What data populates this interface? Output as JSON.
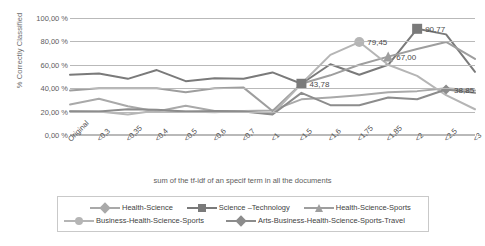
{
  "chart_data": {
    "type": "line",
    "title": "",
    "xlabel": "sum of the tf-idf of an specif term in all the documents",
    "ylabel": "% Correctly Classified",
    "ylim": [
      0,
      100
    ],
    "yticks": [
      "0,00 %",
      "20,00 %",
      "40,00 %",
      "60,00 %",
      "80,00 %",
      "100,00 %"
    ],
    "ytick_values": [
      0,
      20,
      40,
      60,
      80,
      100
    ],
    "grid": true,
    "legend_position": "bottom",
    "categories": [
      "Original",
      "<0,3",
      "<0,35",
      "<0,4",
      "<0,5",
      "<0,6",
      "<0,7",
      "<1",
      "<1,5",
      "<1,6",
      "<1,75",
      "<1,85",
      "<2",
      "<2,5",
      "<3"
    ],
    "series": [
      {
        "name": "Health-Science",
        "color": "#a9a9a9",
        "marker": "diamond",
        "values": [
          26.0,
          31.0,
          24.5,
          20.0,
          25.0,
          20.5,
          20.5,
          21.0,
          30.5,
          32.0,
          34.0,
          36.5,
          37.5,
          40.0,
          38.0
        ]
      },
      {
        "name": "Science –Technology",
        "color": "#7a7a7a",
        "marker": "square",
        "values": [
          51.5,
          52.5,
          48.0,
          55.5,
          46.0,
          48.5,
          48.0,
          53.5,
          43.78,
          60.5,
          51.5,
          60.0,
          90.77,
          86.0,
          54.0
        ]
      },
      {
        "name": "Health-Science-Sports",
        "color": "#9e9e9e",
        "marker": "triangle",
        "values": [
          38.0,
          40.0,
          40.0,
          40.0,
          36.5,
          40.0,
          40.5,
          20.5,
          43.78,
          51.0,
          60.0,
          67.0,
          73.5,
          79.5,
          65.0
        ]
      },
      {
        "name": "Business-Health-Science-Sports",
        "color": "#b5b5b5",
        "marker": "circle",
        "values": [
          20.5,
          20.0,
          17.5,
          21.0,
          20.0,
          19.5,
          20.5,
          18.0,
          43.78,
          68.5,
          79.45,
          60.0,
          50.5,
          34.0,
          22.0
        ]
      },
      {
        "name": "Arts-Business-Health-Science-Sports-Travel",
        "color": "#8c8c8c",
        "marker": "diamond",
        "values": [
          20.0,
          20.0,
          22.0,
          21.5,
          20.0,
          20.5,
          20.0,
          17.5,
          36.0,
          25.5,
          25.5,
          32.0,
          30.5,
          38.85,
          36.0
        ]
      }
    ],
    "annotations": [
      {
        "text": "79,45",
        "series": "Business-Health-Science-Sports",
        "category": "<1,75",
        "value": 79.45
      },
      {
        "text": "43,78",
        "series": "Science –Technology",
        "category": "<1,5",
        "value": 43.78
      },
      {
        "text": "90,77",
        "series": "Science –Technology",
        "category": "<2",
        "value": 90.77
      },
      {
        "text": "67,00",
        "series": "Health-Science-Sports",
        "category": "<1,85",
        "value": 67.0
      },
      {
        "text": "38,85",
        "series": "Arts-Business-Health-Science-Sports-Travel",
        "category": "<2,5",
        "value": 38.85
      }
    ]
  }
}
